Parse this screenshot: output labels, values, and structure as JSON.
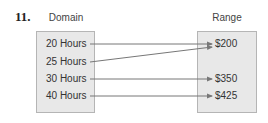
{
  "problem": {
    "number": "11."
  },
  "domain": {
    "title": "Domain",
    "items": [
      "20 Hours",
      "25 Hours",
      "30 Hours",
      "40 Hours"
    ]
  },
  "range": {
    "title": "Range",
    "items": [
      "$200",
      "$350",
      "$425"
    ]
  },
  "mapping": [
    {
      "from": "20 Hours",
      "to": "$200"
    },
    {
      "from": "25 Hours",
      "to": "$200"
    },
    {
      "from": "30 Hours",
      "to": "$350"
    },
    {
      "from": "40 Hours",
      "to": "$425"
    }
  ],
  "colors": {
    "box_fill": "#e8e8e8",
    "box_border": "#b5b5b5",
    "arrow": "#777777",
    "text": "#333333"
  }
}
